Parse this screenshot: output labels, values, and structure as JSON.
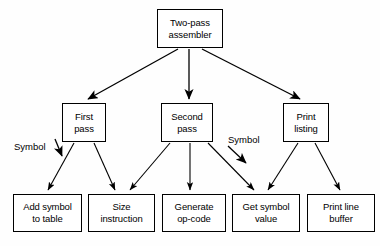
{
  "diagram": {
    "background_color": "#fefefe",
    "line_color": "#000000",
    "box_fill": "#ffffff",
    "nodes": [
      {
        "id": "two-pass-assembler",
        "label": "Two-pass\nassembler",
        "x": 157,
        "y": 9,
        "w": 66,
        "h": 39
      },
      {
        "id": "first-pass",
        "label": "First\npass",
        "x": 62,
        "y": 103,
        "w": 44,
        "h": 39
      },
      {
        "id": "second-pass",
        "label": "Second\npass",
        "x": 161,
        "y": 103,
        "w": 52,
        "h": 39
      },
      {
        "id": "print-listing",
        "label": "Print\nlisting",
        "x": 283,
        "y": 103,
        "w": 46,
        "h": 39
      },
      {
        "id": "add-symbol-to-table",
        "label": "Add symbol\nto table",
        "x": 13,
        "y": 194,
        "w": 69,
        "h": 38
      },
      {
        "id": "size-instruction",
        "label": "Size\ninstruction",
        "x": 88,
        "y": 194,
        "w": 67,
        "h": 38
      },
      {
        "id": "generate-op-code",
        "label": "Generate\nop-code",
        "x": 162,
        "y": 194,
        "w": 64,
        "h": 38
      },
      {
        "id": "get-symbol-value",
        "label": "Get symbol\nvalue",
        "x": 232,
        "y": 194,
        "w": 68,
        "h": 38
      },
      {
        "id": "print-line-buffer",
        "label": "Print line\nbuffer",
        "x": 307,
        "y": 194,
        "w": 68,
        "h": 38
      }
    ],
    "edges": [
      {
        "id": "assembler-to-first-pass",
        "from": "two-pass-assembler",
        "to": "first-pass",
        "label": ""
      },
      {
        "id": "assembler-to-second-pass",
        "from": "two-pass-assembler",
        "to": "second-pass",
        "label": ""
      },
      {
        "id": "assembler-to-print-listing",
        "from": "two-pass-assembler",
        "to": "print-listing",
        "label": ""
      },
      {
        "id": "first-pass-to-add-symbol",
        "from": "first-pass",
        "to": "add-symbol-to-table",
        "label": "Symbol"
      },
      {
        "id": "first-pass-to-size-instruction",
        "from": "first-pass",
        "to": "size-instruction",
        "label": ""
      },
      {
        "id": "second-pass-to-size-instruction",
        "from": "second-pass",
        "to": "size-instruction",
        "label": ""
      },
      {
        "id": "second-pass-to-generate-op-code",
        "from": "second-pass",
        "to": "generate-op-code",
        "label": ""
      },
      {
        "id": "second-pass-to-get-symbol-value",
        "from": "second-pass",
        "to": "get-symbol-value",
        "label": "Symbol"
      },
      {
        "id": "print-listing-to-get-symbol-value",
        "from": "print-listing",
        "to": "get-symbol-value",
        "label": ""
      },
      {
        "id": "print-listing-to-print-line-buffer",
        "from": "print-listing",
        "to": "print-line-buffer",
        "label": ""
      }
    ],
    "edge_labels": [
      {
        "id": "symbol-label-left",
        "text": "Symbol",
        "x": 14,
        "y": 141
      },
      {
        "id": "symbol-label-right",
        "text": "Symbol",
        "x": 228,
        "y": 134
      }
    ]
  }
}
